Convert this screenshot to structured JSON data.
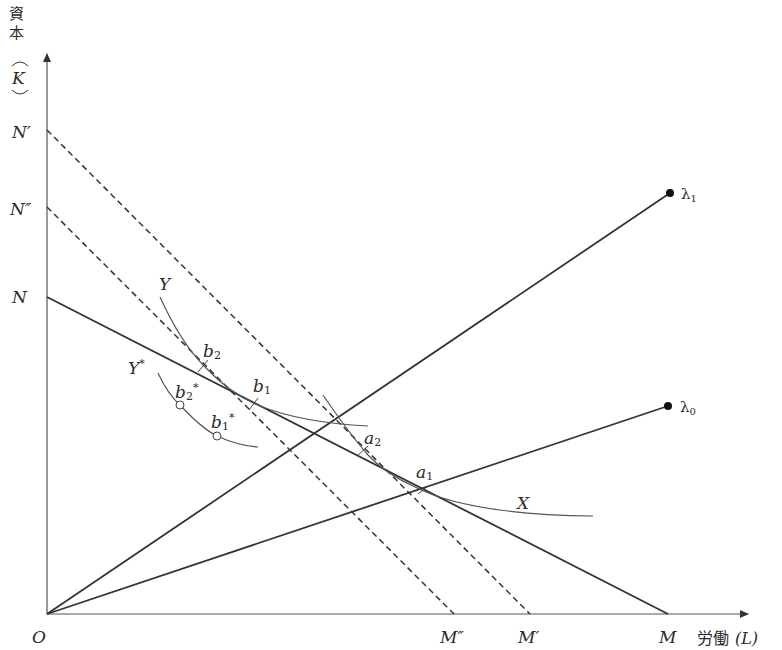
{
  "diagram": {
    "type": "isoquant-isocost",
    "y_axis": {
      "label_jp": "資本",
      "label_symbol": "K"
    },
    "x_axis": {
      "label_jp": "労働",
      "label_symbol": "(L)"
    },
    "origin_label": "O",
    "y_intercepts": [
      {
        "id": "N_prime",
        "label": "N′"
      },
      {
        "id": "N_double_prime",
        "label": "N″"
      },
      {
        "id": "N",
        "label": "N"
      }
    ],
    "x_intercepts": [
      {
        "id": "M_double_prime",
        "label": "M″"
      },
      {
        "id": "M_prime",
        "label": "M′"
      },
      {
        "id": "M",
        "label": "M"
      }
    ],
    "isocost_lines": [
      {
        "name": "NM",
        "from": "N",
        "to": "M",
        "style": "solid"
      },
      {
        "name": "N′M′",
        "from": "N′",
        "to": "M′",
        "style": "dashed"
      },
      {
        "name": "N″M″",
        "from": "N″",
        "to": "M″",
        "style": "dashed"
      }
    ],
    "rays": [
      {
        "id": "lambda1",
        "label": "λ",
        "sub": "1"
      },
      {
        "id": "lambda0",
        "label": "λ",
        "sub": "0"
      }
    ],
    "isoquants": [
      {
        "id": "X",
        "label": "X"
      },
      {
        "id": "Y",
        "label": "Y"
      },
      {
        "id": "Y_star",
        "label": "Y",
        "sup": "*"
      }
    ],
    "points": [
      {
        "id": "a1",
        "label": "a",
        "sub": "1"
      },
      {
        "id": "a2",
        "label": "a",
        "sub": "2"
      },
      {
        "id": "b1",
        "label": "b",
        "sub": "1"
      },
      {
        "id": "b2",
        "label": "b",
        "sub": "2"
      },
      {
        "id": "b1_star",
        "label": "b",
        "sub": "1",
        "sup": "*"
      },
      {
        "id": "b2_star",
        "label": "b",
        "sub": "2",
        "sup": "*"
      }
    ]
  }
}
